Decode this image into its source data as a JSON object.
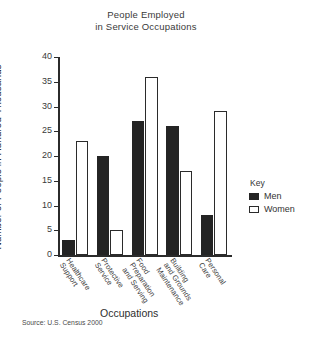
{
  "chart_data": {
    "type": "bar",
    "title": "People Employed in Service Occupations",
    "title_lines": [
      "People Employed",
      "in Service Occupations"
    ],
    "xlabel": "Occupations",
    "ylabel": "Number of People in Hundred-Thousands",
    "ylim": [
      0,
      40
    ],
    "ytick_step": 5,
    "yticks": [
      0,
      5,
      10,
      15,
      20,
      25,
      30,
      35,
      40
    ],
    "grid": false,
    "legend_position": "right",
    "legend_title": "Key",
    "source": "Source: U.S. Census 2000",
    "categories": [
      "Healthcare Support",
      "Protective Service",
      "Food Preparation and Serving",
      "Building and Grounds Maintenance",
      "Personal Care"
    ],
    "category_label_lines": [
      [
        "Healthcare",
        "Support"
      ],
      [
        "Protective",
        "Service"
      ],
      [
        "Food",
        "Preparation",
        "and Serving"
      ],
      [
        "Building",
        "and Grounds",
        "Maintenance"
      ],
      [
        "Personal",
        "Care"
      ]
    ],
    "series": [
      {
        "name": "Men",
        "color": "#242424",
        "values": [
          3,
          20,
          27,
          26,
          8
        ]
      },
      {
        "name": "Women",
        "color": "#ffffff",
        "values": [
          23,
          5,
          36,
          17,
          29
        ]
      }
    ]
  }
}
